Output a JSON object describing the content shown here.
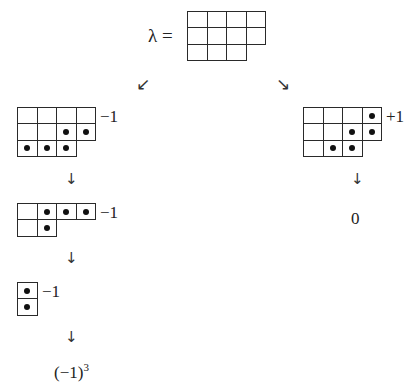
{
  "diagram": {
    "root": {
      "label": "λ =",
      "partition": [
        4,
        4,
        3
      ],
      "dots": []
    },
    "branch_arrows": {
      "left": "↙",
      "right": "↘"
    },
    "left_branch": {
      "steps": [
        {
          "partition": [
            4,
            4,
            3
          ],
          "dots": [
            [
              1,
              2
            ],
            [
              1,
              3
            ],
            [
              2,
              0
            ],
            [
              2,
              1
            ],
            [
              2,
              2
            ]
          ],
          "sign": "−1"
        },
        {
          "partition": [
            4,
            2
          ],
          "dots": [
            [
              0,
              1
            ],
            [
              0,
              2
            ],
            [
              0,
              3
            ],
            [
              1,
              1
            ]
          ],
          "sign": "−1"
        },
        {
          "partition": [
            1,
            1
          ],
          "dots": [
            [
              0,
              0
            ],
            [
              1,
              0
            ]
          ],
          "sign": "−1"
        }
      ],
      "down_arrow": "↓",
      "result": {
        "base": "(−1)",
        "exponent": "3"
      }
    },
    "right_branch": {
      "steps": [
        {
          "partition": [
            4,
            4,
            3
          ],
          "dots": [
            [
              0,
              3
            ],
            [
              1,
              2
            ],
            [
              1,
              3
            ],
            [
              2,
              1
            ],
            [
              2,
              2
            ]
          ],
          "sign": "+1"
        }
      ],
      "down_arrow": "↓",
      "result": "0"
    }
  }
}
